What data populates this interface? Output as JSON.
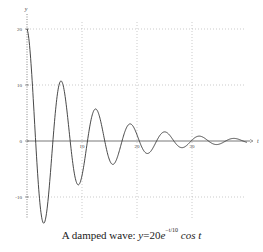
{
  "chart_data": {
    "type": "line",
    "caption_prefix": "A damped wave: ",
    "formula": {
      "lhs": "y",
      "coef": "=20",
      "base": "e",
      "exponent": "−t/10",
      "tail": "cos t"
    },
    "xlabel": "t",
    "ylabel": "y",
    "xlim": [
      0,
      42
    ],
    "ylim": [
      -18,
      22
    ],
    "x_ticks": [
      10,
      20,
      30
    ],
    "y_ticks": [
      20,
      10,
      0,
      -10
    ],
    "grid": true,
    "series": [
      {
        "name": "y = 20 e^(-t/10) cos t",
        "function": "20*exp(-t/10)*cos(t)",
        "t_range": [
          0,
          40
        ],
        "sample_points": [
          {
            "t": 0,
            "y": 20
          },
          {
            "t": 3.14,
            "y": -14.6
          },
          {
            "t": 6.28,
            "y": 10.7
          },
          {
            "t": 9.42,
            "y": -7.8
          },
          {
            "t": 12.57,
            "y": 5.7
          },
          {
            "t": 15.71,
            "y": -4.2
          },
          {
            "t": 18.85,
            "y": 3.0
          },
          {
            "t": 21.99,
            "y": -2.2
          },
          {
            "t": 25.13,
            "y": 1.6
          },
          {
            "t": 28.27,
            "y": -1.2
          },
          {
            "t": 31.42,
            "y": 0.9
          },
          {
            "t": 34.56,
            "y": -0.6
          },
          {
            "t": 37.7,
            "y": 0.5
          }
        ]
      }
    ],
    "colors": {
      "curve": "#333333",
      "axis": "#555555",
      "grid": "#aaaaaa"
    }
  }
}
